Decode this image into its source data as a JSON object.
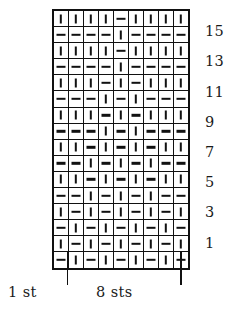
{
  "chart_data": {
    "type": "table",
    "title": "",
    "rows": 16,
    "columns": 9,
    "symbol_legend": {
      "knit": "|",
      "purl": "-"
    },
    "row_labels_right": [
      "15",
      "13",
      "11",
      "9",
      "7",
      "5",
      "3",
      "1"
    ],
    "row_label_rows": [
      15,
      13,
      11,
      9,
      7,
      5,
      3,
      1
    ],
    "captions": {
      "edge_stitch": "1 st",
      "repeat": "8 sts"
    },
    "grid_top_to_bottom": [
      {
        "row": 16,
        "cells": [
          "|",
          "|",
          "|",
          "|",
          "-",
          "|",
          "|",
          "|",
          "|"
        ]
      },
      {
        "row": 15,
        "cells": [
          "-",
          "-",
          "-",
          "-",
          "|",
          "-",
          "-",
          "-",
          "-"
        ]
      },
      {
        "row": 14,
        "cells": [
          "|",
          "|",
          "|",
          "|",
          "-",
          "|",
          "|",
          "|",
          "|"
        ]
      },
      {
        "row": 13,
        "cells": [
          "-",
          "-",
          "-",
          "-",
          "|",
          "-",
          "-",
          "-",
          "-"
        ]
      },
      {
        "row": 12,
        "cells": [
          "|",
          "|",
          "|",
          "-",
          "|",
          "-",
          "|",
          "|",
          "|"
        ]
      },
      {
        "row": 11,
        "cells": [
          "-",
          "-",
          "-",
          "|",
          "-",
          "|",
          "-",
          "-",
          "-"
        ]
      },
      {
        "row": 10,
        "cells": [
          "|",
          "|",
          "|",
          "-",
          "|",
          "-",
          "|",
          "|",
          "|"
        ]
      },
      {
        "row": 9,
        "cells": [
          "-",
          "-",
          "-",
          "|",
          "-",
          "|",
          "-",
          "-",
          "-"
        ]
      },
      {
        "row": 8,
        "cells": [
          "|",
          "|",
          "-",
          "|",
          "-",
          "|",
          "-",
          "|",
          "|"
        ]
      },
      {
        "row": 7,
        "cells": [
          "-",
          "-",
          "|",
          "-",
          "|",
          "-",
          "|",
          "-",
          "-"
        ]
      },
      {
        "row": 6,
        "cells": [
          "|",
          "|",
          "-",
          "|",
          "-",
          "|",
          "-",
          "|",
          "|"
        ]
      },
      {
        "row": 5,
        "cells": [
          "-",
          "-",
          "|",
          "-",
          "|",
          "-",
          "|",
          "-",
          "-"
        ]
      },
      {
        "row": 4,
        "cells": [
          "|",
          "-",
          "|",
          "-",
          "|",
          "-",
          "|",
          "-",
          "|"
        ]
      },
      {
        "row": 3,
        "cells": [
          "-",
          "|",
          "-",
          "|",
          "-",
          "|",
          "-",
          "|",
          "-"
        ]
      },
      {
        "row": 2,
        "cells": [
          "|",
          "-",
          "|",
          "-",
          "|",
          "-",
          "|",
          "-",
          "|"
        ]
      },
      {
        "row": 1,
        "cells": [
          "-",
          "|",
          "-",
          "|",
          "-",
          "|",
          "-",
          "|",
          "-"
        ]
      }
    ]
  }
}
